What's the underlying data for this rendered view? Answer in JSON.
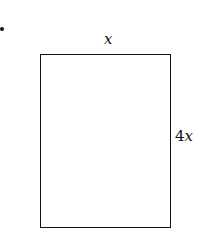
{
  "figure": {
    "shape": "rectangle",
    "top_label": "x",
    "side_label_coef": "4",
    "side_label_var": "x",
    "side_label": "4x"
  }
}
